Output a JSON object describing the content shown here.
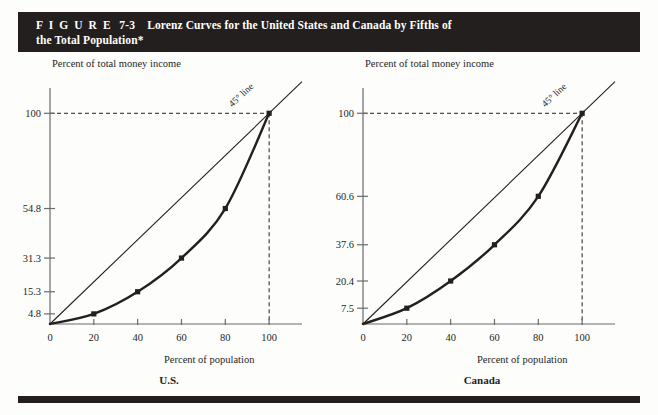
{
  "figure": {
    "label": "F I G U R E",
    "number": "7-3",
    "title_line1": "Lorenz Curves for the United States and Canada by Fifths of",
    "title_line2": "the Total Population*"
  },
  "colors": {
    "banner_bg": "#231f1e",
    "banner_text": "#ffffff",
    "page_bg": "#fdfdfc",
    "ink": "#231f1e",
    "axis": "#6b6b6b"
  },
  "chart_data": [
    {
      "type": "line",
      "title": "U.S.",
      "xlabel": "Percent of population",
      "ylabel": "Percent of total money income",
      "xlim": [
        0,
        115
      ],
      "ylim": [
        0,
        112
      ],
      "grid": false,
      "xticks": [
        0,
        20,
        40,
        60,
        80,
        100
      ],
      "xticklabels": [
        "0",
        "20",
        "40",
        "60",
        "80",
        "100"
      ],
      "yticks": [
        4.8,
        15.3,
        31.3,
        54.8,
        100
      ],
      "yticklabels": [
        "4.8",
        "15.3",
        "31.3",
        "54.8",
        "100"
      ],
      "series": [
        {
          "name": "45° line",
          "annotation": "45° line",
          "x": [
            0,
            115
          ],
          "values": [
            0,
            115
          ],
          "markers": false
        },
        {
          "name": "Lorenz curve",
          "x": [
            0,
            20,
            40,
            60,
            80,
            100
          ],
          "values": [
            0,
            4.8,
            15.3,
            31.3,
            54.8,
            100
          ],
          "markers": true
        }
      ],
      "reference_lines": [
        {
          "orientation": "horizontal",
          "value": 100,
          "style": "dashed"
        },
        {
          "orientation": "vertical",
          "value": 100,
          "style": "dashed"
        }
      ]
    },
    {
      "type": "line",
      "title": "Canada",
      "xlabel": "Percent of population",
      "ylabel": "Percent of total money income",
      "xlim": [
        0,
        115
      ],
      "ylim": [
        0,
        112
      ],
      "grid": false,
      "xticks": [
        0,
        20,
        40,
        60,
        80,
        100
      ],
      "xticklabels": [
        "0",
        "20",
        "40",
        "60",
        "80",
        "100"
      ],
      "yticks": [
        7.5,
        20.4,
        37.6,
        60.6,
        100
      ],
      "yticklabels": [
        "7.5",
        "20.4",
        "37.6",
        "60.6",
        "100"
      ],
      "series": [
        {
          "name": "45° line",
          "annotation": "45° line",
          "x": [
            0,
            115
          ],
          "values": [
            0,
            115
          ],
          "markers": false
        },
        {
          "name": "Lorenz curve",
          "x": [
            0,
            20,
            40,
            60,
            80,
            100
          ],
          "values": [
            0,
            7.5,
            20.4,
            37.6,
            60.6,
            100
          ],
          "markers": true
        }
      ],
      "reference_lines": [
        {
          "orientation": "horizontal",
          "value": 100,
          "style": "dashed"
        },
        {
          "orientation": "vertical",
          "value": 100,
          "style": "dashed"
        }
      ]
    }
  ]
}
